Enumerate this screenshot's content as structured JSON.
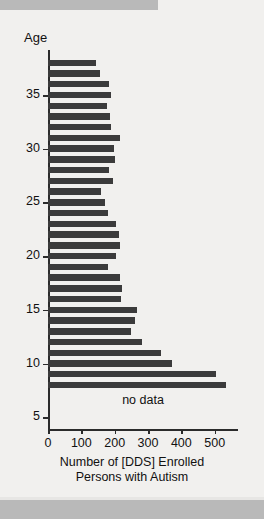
{
  "figure": {
    "background_color": "#f1f0ee",
    "bar_color": "#3b3b3b",
    "axis_color": "#2b2b2b",
    "band_color": "#b9b9b9"
  },
  "annotations": {
    "no_data": "no data"
  },
  "chart_data": {
    "type": "bar",
    "orientation": "horizontal",
    "title": "",
    "xlabel_line1": "Number of [DDS] Enrolled",
    "xlabel_line2": "Persons with Autism",
    "ylabel": "Age",
    "xlim": [
      0,
      600
    ],
    "ylim": [
      4,
      39
    ],
    "grid": false,
    "legend": null,
    "xticks": [
      0,
      100,
      200,
      300,
      400,
      500
    ],
    "xtick_labels": [
      "0",
      "100",
      "200",
      "300",
      "400",
      "500"
    ],
    "yticks": [
      35,
      30,
      25,
      20,
      15,
      10,
      5
    ],
    "ytick_labels": [
      "35",
      "30",
      "25",
      "20",
      "15",
      "10",
      "5"
    ],
    "categories": [
      38,
      37,
      36,
      35,
      34,
      33,
      32,
      31,
      30,
      29,
      28,
      27,
      26,
      25,
      24,
      23,
      22,
      21,
      20,
      19,
      18,
      17,
      16,
      15,
      14,
      13,
      12,
      11,
      10,
      9,
      8
    ],
    "values": [
      143,
      155,
      182,
      188,
      178,
      187,
      190,
      215,
      198,
      202,
      182,
      196,
      160,
      172,
      180,
      205,
      212,
      215,
      204,
      180,
      215,
      222,
      218,
      266,
      262,
      250,
      282,
      338,
      372,
      505,
      535
    ],
    "note": "Ages below 8 have no data"
  }
}
